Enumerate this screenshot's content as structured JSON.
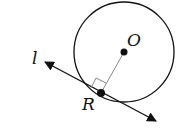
{
  "diagram": {
    "type": "geometry",
    "labels": {
      "center": "O",
      "point": "R",
      "line": "l"
    },
    "circle": {
      "cx": 124,
      "cy": 52,
      "r": 50
    },
    "points": {
      "O": [
        124,
        52
      ],
      "R": [
        101,
        93
      ]
    },
    "line_l": {
      "from": [
        43,
        60
      ],
      "to": [
        158,
        122
      ],
      "arrows": "both"
    },
    "right_angle_marker": true,
    "colors": {
      "stroke": "#111111",
      "radius": "#888888",
      "background": "#ffffff"
    }
  }
}
